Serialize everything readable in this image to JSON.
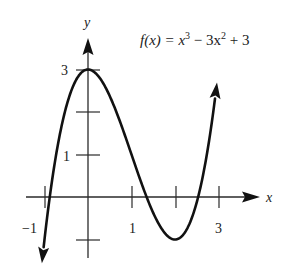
{
  "chart_data": {
    "type": "line",
    "function": "x^3 - 3x^2 + 3",
    "xlabel": "x",
    "ylabel": "y",
    "xlim": [
      -1.1,
      3.2
    ],
    "ylim": [
      -1.3,
      3.4
    ],
    "grid": false,
    "x_ticks": [
      -1,
      1,
      2,
      3
    ],
    "x_tick_labels": [
      "-1",
      "1",
      "",
      "3"
    ],
    "y_ticks": [
      -1,
      1,
      2,
      3
    ],
    "y_tick_labels": [
      "",
      "1",
      "",
      "3"
    ],
    "key_points": [
      {
        "label": "local max",
        "x": 0,
        "y": 3
      },
      {
        "label": "local min",
        "x": 2,
        "y": -1
      }
    ],
    "series": [
      {
        "name": "f(x)",
        "x": [
          -1,
          -0.5,
          0,
          0.5,
          1,
          1.5,
          2,
          2.5,
          3
        ],
        "y": [
          -1,
          2.125,
          3,
          2.375,
          1,
          -0.375,
          -1,
          -0.125,
          3
        ]
      }
    ],
    "annotations": [
      "f(x) = x³ − 3x² + 3"
    ]
  },
  "labels": {
    "y_axis": "y",
    "x_axis": "x",
    "y_tick_3": "3",
    "y_tick_1": "1",
    "x_tick_neg1": "−1",
    "x_tick_1": "1",
    "x_tick_3": "3",
    "equation_prefix": "f(x) = x",
    "equation_exp3": "3",
    "equation_mid": " − 3x",
    "equation_exp2": "2",
    "equation_suffix": " + 3"
  }
}
